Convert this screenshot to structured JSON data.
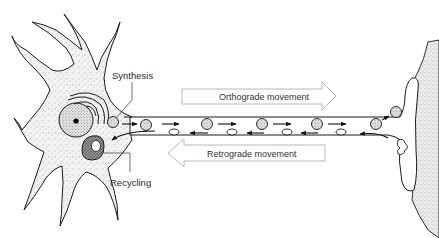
{
  "diagram": {
    "labels": {
      "synthesis": "Synthesis",
      "recycling": "Recycling",
      "orthograde": "Orthograde movement",
      "retrograde": "Retrograde movement"
    },
    "components": [
      "cell-body",
      "nucleus",
      "nucleolus",
      "golgi-apparatus",
      "synthesis-vesicle",
      "lysosome",
      "dendrites",
      "axon",
      "transport-vesicles",
      "retrograde-vesicles",
      "synaptic-terminal",
      "target-cell"
    ],
    "orthograde_vesicles": 5,
    "retrograde_ovals": 4,
    "colors": {
      "line": "#1a1a1a",
      "arrow_outline": "#b8b8b8",
      "background": "#ffffff"
    }
  }
}
